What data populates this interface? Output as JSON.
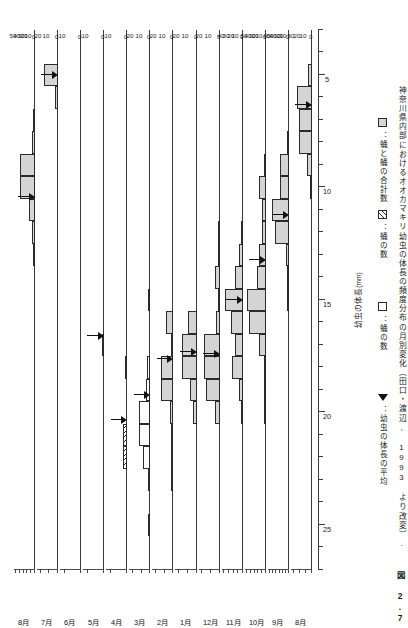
{
  "figure": {
    "number": "図 2.7",
    "caption": "神奈川県内部におけるオオカマキリ幼虫の体長の頻度分布の月別変化（田口・渡辺, 1993 より改変）."
  },
  "axes": {
    "x_title": "幼虫の体長",
    "x_unit": "(mm)",
    "x_tick_labels": [
      "25",
      "20",
      "15",
      "10",
      "5"
    ],
    "x_tick_values": [
      25,
      20,
      15,
      10,
      5
    ],
    "x_min": 27,
    "x_max": 3,
    "x_minor_step": 1,
    "y_title": "個体数"
  },
  "legend": {
    "items": [
      {
        "swatch": "total",
        "label": "：蛹と蛹の合計数"
      },
      {
        "swatch": "egg",
        "label": "：蛹の数"
      },
      {
        "swatch": "pupa",
        "label": "：蛹の数"
      },
      {
        "swatch": "mean",
        "label": "：幼虫の体長の平均"
      }
    ]
  },
  "chart_data": {
    "type": "bar",
    "title": "オオカマキリ幼虫の体長の頻度分布の月別変化",
    "xlabel": "幼虫の体長 (mm)",
    "ylabel": "個体数",
    "grid": false,
    "legend_position": "right",
    "x_axis_reversed": true,
    "bin_width": 1,
    "panels": [
      {
        "month": "8月",
        "y_ticks": [
          0,
          10,
          20,
          30,
          40,
          50
        ],
        "ymax": 50,
        "mean": 10.4,
        "series": [
          {
            "name": "total",
            "bins": [
              {
                "x": 13,
                "v": 2
              },
              {
                "x": 12,
                "v": 8
              },
              {
                "x": 11,
                "v": 17
              },
              {
                "x": 10,
                "v": 40
              },
              {
                "x": 9,
                "v": 40
              },
              {
                "x": 8,
                "v": 9
              },
              {
                "x": 7,
                "v": 1
              }
            ]
          }
        ]
      },
      {
        "month": "7月",
        "y_ticks": [
          0,
          10,
          20
        ],
        "ymax": 22,
        "mean": 5.0,
        "series": [
          {
            "name": "total",
            "bins": [
              {
                "x": 6,
                "v": 4
              },
              {
                "x": 5,
                "v": 16
              }
            ]
          }
        ]
      },
      {
        "month": "6月",
        "y_ticks": [
          0,
          10
        ],
        "ymax": 12,
        "mean": null,
        "series": [
          {
            "name": "total",
            "bins": []
          }
        ]
      },
      {
        "month": "5月",
        "y_ticks": [
          0,
          10
        ],
        "ymax": 12,
        "mean": 16.6,
        "series": [
          {
            "name": "total",
            "bins": [
              {
                "x": 17,
                "v": 1
              }
            ]
          }
        ]
      },
      {
        "month": "4月",
        "y_ticks": [
          0,
          10
        ],
        "ymax": 12,
        "mean": 20.3,
        "series": [
          {
            "name": "egg",
            "bins": [
              {
                "x": 22,
                "v": 3
              },
              {
                "x": 21,
                "v": 3
              }
            ]
          },
          {
            "name": "total",
            "bins": [
              {
                "x": 18,
                "v": 1
              }
            ]
          }
        ]
      },
      {
        "month": "3月",
        "y_ticks": [
          0,
          10,
          20
        ],
        "ymax": 22,
        "mean": 19.2,
        "series": [
          {
            "name": "egg",
            "bins": [
              {
                "x": 25,
                "v": 1
              },
              {
                "x": 23,
                "v": 2
              },
              {
                "x": 22,
                "v": 2
              },
              {
                "x": 21,
                "v": 2
              },
              {
                "x": 20,
                "v": 2
              },
              {
                "x": 19,
                "v": 2
              },
              {
                "x": 18,
                "v": 2
              },
              {
                "x": 15,
                "v": 1
              }
            ]
          },
          {
            "name": "pupa",
            "bins": [
              {
                "x": 22,
                "v": 8
              },
              {
                "x": 21,
                "v": 13
              },
              {
                "x": 20,
                "v": 13
              },
              {
                "x": 19,
                "v": 5
              },
              {
                "x": 18,
                "v": 4
              }
            ]
          }
        ]
      },
      {
        "month": "2月",
        "y_ticks": [
          0,
          10,
          20
        ],
        "ymax": 22,
        "mean": 17.6,
        "series": [
          {
            "name": "total",
            "bins": [
              {
                "x": 23,
                "v": 3
              },
              {
                "x": 22,
                "v": 2
              },
              {
                "x": 21,
                "v": 3
              },
              {
                "x": 20,
                "v": 4
              },
              {
                "x": 19,
                "v": 14
              },
              {
                "x": 18,
                "v": 14
              },
              {
                "x": 17,
                "v": 2
              },
              {
                "x": 16,
                "v": 9
              }
            ]
          }
        ]
      },
      {
        "month": "1月",
        "y_ticks": [
          0,
          10,
          20
        ],
        "ymax": 22,
        "mean": 17.3,
        "series": [
          {
            "name": "total",
            "bins": [
              {
                "x": 20,
                "v": 4
              },
              {
                "x": 19,
                "v": 8
              },
              {
                "x": 18,
                "v": 17
              },
              {
                "x": 17,
                "v": 17
              },
              {
                "x": 16,
                "v": 10
              }
            ]
          }
        ]
      },
      {
        "month": "12月",
        "y_ticks": [
          0,
          10,
          20
        ],
        "ymax": 22,
        "mean": 17.4,
        "series": [
          {
            "name": "total",
            "bins": [
              {
                "x": 20,
                "v": 5
              },
              {
                "x": 19,
                "v": 16
              },
              {
                "x": 18,
                "v": 18
              },
              {
                "x": 17,
                "v": 18
              },
              {
                "x": 16,
                "v": 4
              },
              {
                "x": 15,
                "v": 2
              },
              {
                "x": 14,
                "v": 5
              },
              {
                "x": 13,
                "v": 2
              },
              {
                "x": 12,
                "v": 2
              }
            ]
          }
        ]
      },
      {
        "month": "11月",
        "y_ticks": [
          0,
          10,
          20,
          30,
          40
        ],
        "ymax": 42,
        "mean": 15.0,
        "series": [
          {
            "name": "total",
            "bins": [
              {
                "x": 20,
                "v": 2
              },
              {
                "x": 19,
                "v": 9
              },
              {
                "x": 18,
                "v": 23
              },
              {
                "x": 17,
                "v": 17
              },
              {
                "x": 16,
                "v": 26
              },
              {
                "x": 15,
                "v": 38
              },
              {
                "x": 14,
                "v": 16
              },
              {
                "x": 13,
                "v": 7
              },
              {
                "x": 12,
                "v": 4
              }
            ]
          }
        ]
      },
      {
        "month": "10月",
        "y_ticks": [
          0,
          10,
          20,
          30,
          40,
          50
        ],
        "ymax": 52,
        "mean": 13.2,
        "series": [
          {
            "name": "total",
            "bins": [
              {
                "x": 20,
                "v": 1
              },
              {
                "x": 19,
                "v": 2
              },
              {
                "x": 18,
                "v": 6
              },
              {
                "x": 17,
                "v": 18
              },
              {
                "x": 16,
                "v": 45
              },
              {
                "x": 15,
                "v": 50
              },
              {
                "x": 14,
                "v": 24
              },
              {
                "x": 13,
                "v": 19
              },
              {
                "x": 12,
                "v": 9
              },
              {
                "x": 11,
                "v": 10
              },
              {
                "x": 10,
                "v": 17
              },
              {
                "x": 9,
                "v": 4
              }
            ]
          }
        ]
      },
      {
        "month": "9月",
        "y_ticks": [
          0,
          10,
          20,
          30,
          40,
          50,
          60
        ],
        "ymax": 62,
        "mean": 11.2,
        "series": [
          {
            "name": "total",
            "bins": [
              {
                "x": 15,
                "v": 2
              },
              {
                "x": 14,
                "v": 3
              },
              {
                "x": 13,
                "v": 8
              },
              {
                "x": 12,
                "v": 45
              },
              {
                "x": 11,
                "v": 53
              },
              {
                "x": 10,
                "v": 28
              },
              {
                "x": 9,
                "v": 29
              },
              {
                "x": 8,
                "v": 2
              }
            ]
          }
        ]
      },
      {
        "month": "8月",
        "y_ticks": [
          0,
          10,
          20,
          30
        ],
        "ymax": 32,
        "mean": 6.3,
        "series": [
          {
            "name": "total",
            "bins": [
              {
                "x": 10,
                "v": 2
              },
              {
                "x": 9,
                "v": 8
              },
              {
                "x": 8,
                "v": 22
              },
              {
                "x": 7,
                "v": 22
              },
              {
                "x": 6,
                "v": 25
              },
              {
                "x": 5,
                "v": 7
              }
            ]
          }
        ]
      }
    ]
  }
}
